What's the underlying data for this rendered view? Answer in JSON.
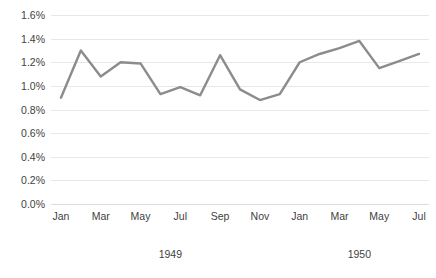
{
  "chart_data": {
    "type": "line",
    "title": "",
    "subtitle": "",
    "xlabel": "",
    "ylabel": "",
    "ylim": [
      0.0,
      1.6
    ],
    "y_tick_labels": [
      "1.6%",
      "1.4%",
      "1.2%",
      "1.0%",
      "0.8%",
      "0.6%",
      "0.4%",
      "0.2%",
      "0.0%"
    ],
    "y_tick_values": [
      1.6,
      1.4,
      1.2,
      1.0,
      0.8,
      0.6,
      0.4,
      0.2,
      0.0
    ],
    "grid": true,
    "legend": "none",
    "x_tick_labels": [
      "Jan",
      "Mar",
      "May",
      "Jul",
      "Sep",
      "Nov",
      "Jan",
      "Mar",
      "May",
      "Jul"
    ],
    "x_group_labels": [
      "1949",
      "1950"
    ],
    "categories": [
      "Jan 1949",
      "Feb 1949",
      "Mar 1949",
      "Apr 1949",
      "May 1949",
      "Jun 1949",
      "Jul 1949",
      "Aug 1949",
      "Sep 1949",
      "Oct 1949",
      "Nov 1949",
      "Dec 1949",
      "Jan 1950",
      "Feb 1950",
      "Mar 1950",
      "Apr 1950",
      "May 1950",
      "Jun 1950",
      "Jul 1950"
    ],
    "values": [
      0.9,
      1.3,
      1.08,
      1.2,
      1.19,
      0.93,
      0.99,
      0.92,
      1.26,
      0.97,
      0.88,
      0.93,
      1.2,
      1.27,
      1.32,
      1.38,
      1.15,
      1.21,
      1.27
    ],
    "series": [
      {
        "name": "Series 1",
        "color": "#8c8c8c",
        "values": [
          0.9,
          1.3,
          1.08,
          1.2,
          1.19,
          0.93,
          0.99,
          0.92,
          1.26,
          0.97,
          0.88,
          0.93,
          1.2,
          1.27,
          1.32,
          1.38,
          1.15,
          1.21,
          1.27
        ]
      }
    ]
  },
  "style": {
    "line_color": "#8c8c8c",
    "grid_color": "#e8e8e8",
    "background": "#ffffff",
    "text_color": "#3f3f3f"
  }
}
